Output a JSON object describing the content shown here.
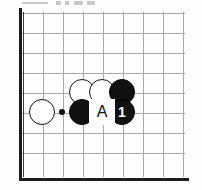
{
  "figure": {
    "kind": "go-board-diagram",
    "width": 202,
    "height": 190,
    "background_color": "#ffffff"
  },
  "board": {
    "columns": 9,
    "rows": 8,
    "cell_size": 20,
    "origin_x": 22,
    "origin_y": 12,
    "line_color": "#a9a9a9",
    "edge_color": "#1c1c1c",
    "board_color": "#fdfdfd",
    "edges": [
      {
        "name": "left-board-edge",
        "side": "left"
      },
      {
        "name": "bottom-board-edge",
        "side": "bottom"
      }
    ],
    "star_points": [
      {
        "name": "star-point",
        "col": 2,
        "row": 5
      }
    ]
  },
  "stones": [
    {
      "id": "white-stone-1",
      "color": "white",
      "col": 3,
      "row": 4,
      "label": ""
    },
    {
      "id": "white-stone-2",
      "color": "white",
      "col": 4,
      "row": 4,
      "label": ""
    },
    {
      "id": "black-stone-1",
      "color": "black",
      "col": 5,
      "row": 4,
      "label": ""
    },
    {
      "id": "white-stone-3",
      "color": "white",
      "col": 1,
      "row": 5,
      "label": ""
    },
    {
      "id": "black-stone-2",
      "color": "black",
      "col": 3,
      "row": 5,
      "label": ""
    },
    {
      "id": "black-stone-move-1",
      "color": "black",
      "col": 5,
      "row": 5,
      "label": "1"
    }
  ],
  "point_labels": [
    {
      "id": "point-label-a",
      "text": "A",
      "col": 4,
      "row": 5
    }
  ],
  "colors": {
    "black_stone": "#111111",
    "white_stone": "#ffffff",
    "stone_outline": "#141414",
    "white_number": "#ffffff",
    "grid": "#a9a9a9",
    "edge": "#1c1c1c"
  }
}
